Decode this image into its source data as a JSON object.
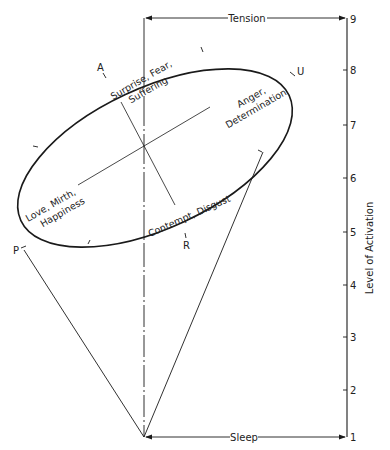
{
  "diagram": {
    "top_arrow_label": "Tension",
    "bottom_arrow_label": "Sleep",
    "axis_title": "Level of Activation",
    "axis_ticks": [
      "1",
      "2",
      "3",
      "4",
      "5",
      "6",
      "7",
      "8",
      "9"
    ],
    "points": {
      "A": "A",
      "U": "U",
      "P": "P",
      "R": "R"
    },
    "emotion_labels": {
      "surprise_line1": "Surprise, Fear,",
      "surprise_line2": "Suffering",
      "anger_line1": "Anger,",
      "anger_line2": "Determination",
      "love_line1": "Love, Mirth,",
      "love_line2": "Happiness",
      "contempt_line1": "Contempt, Disgust"
    },
    "colors": {
      "stroke": "#1a1a1a",
      "background": "#ffffff"
    }
  }
}
